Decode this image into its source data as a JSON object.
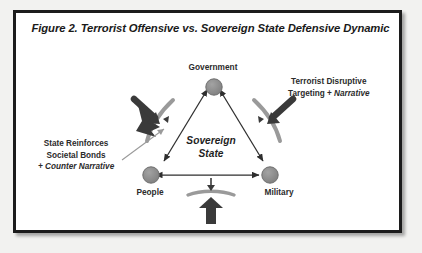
{
  "figure": {
    "title": "Figure 2. Terrorist Offensive vs. Sovereign State Defensive Dynamic",
    "center_label_line1": "Sovereign",
    "center_label_line2": "State"
  },
  "nodes": [
    {
      "id": "government",
      "label": "Government"
    },
    {
      "id": "people",
      "label": "People"
    },
    {
      "id": "military",
      "label": "Military"
    }
  ],
  "annotations": {
    "left": {
      "line1": "State  Reinforces",
      "line2": "Societal Bonds",
      "line3": "+ Counter Narrative"
    },
    "right": {
      "line1": "Terrorist Disruptive",
      "line2_plain": "Targeting + ",
      "line2_italic": "Narrative"
    }
  },
  "colors": {
    "frame_border": "#1c1c1c",
    "page_background": "#f2f2f0",
    "panel_background": "#ffffff",
    "node_fill": "#8e8e8e",
    "node_stroke": "#6f6f6f",
    "arrow_dark": "#2e2e2e",
    "shield_arc": "#9a9a9a",
    "leader_line": "#9a9a9a",
    "text": "#2b2b2b"
  }
}
